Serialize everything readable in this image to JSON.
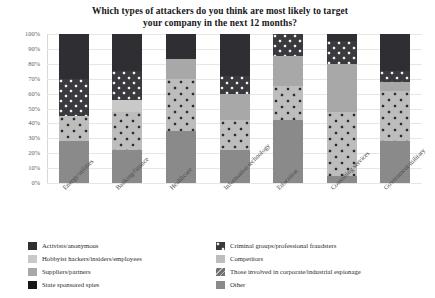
{
  "chart_data": {
    "type": "bar",
    "title": "Which types of attackers do you think are most likely to target your company in the next 12 months?",
    "title_line1": "Which types of attackers do you think are most likely to target",
    "title_line2": "your company in the next 12 months?",
    "xlabel": "",
    "ylabel": "",
    "ylim": [
      0,
      100
    ],
    "ytick_labels": [
      "100%",
      "90%",
      "80%",
      "70%",
      "60%",
      "50%",
      "40%",
      "30%",
      "20%",
      "10%",
      "0%"
    ],
    "ytick_values": [
      100,
      90,
      80,
      70,
      60,
      50,
      40,
      30,
      20,
      10,
      0
    ],
    "grid": true,
    "stacked": true,
    "stack_mode": "percent",
    "legend_position": "bottom",
    "categories": [
      "Energy/utilities",
      "Banking/finance",
      "Healthcare",
      "Information technology",
      "Education",
      "Consulting services",
      "Government/military"
    ],
    "series": [
      {
        "name": "Other",
        "pattern": "solid",
        "color": "#8a8a8a",
        "values": [
          28,
          22,
          35,
          22,
          42,
          5,
          28
        ]
      },
      {
        "name": "Competitors",
        "pattern": "dots",
        "color": "#bdbdbd",
        "values": [
          17,
          26,
          35,
          20,
          23,
          43,
          34
        ]
      },
      {
        "name": "Those involved in corporate/industrial espionage",
        "pattern": "diagonal",
        "color": "#6f6f74",
        "values": [
          0,
          0,
          0,
          0,
          0,
          0,
          0
        ]
      },
      {
        "name": "Suppliers/partners",
        "pattern": "solid",
        "color": "#a8a8a8",
        "values": [
          0,
          0,
          13,
          18,
          20,
          32,
          6
        ]
      },
      {
        "name": "Hobbyist hackers/insiders/employees",
        "pattern": "solid",
        "color": "#c9c9c9",
        "values": [
          0,
          8,
          0,
          0,
          0,
          0,
          0
        ]
      },
      {
        "name": "Criminal groups/professional fraudsters",
        "pattern": "checker",
        "color": "#3a3a3e",
        "values": [
          25,
          19,
          0,
          12,
          15,
          15,
          7
        ]
      },
      {
        "name": "Activists/anonymous",
        "pattern": "solid",
        "color": "#2f2f33",
        "values": [
          30,
          25,
          17,
          28,
          0,
          5,
          25
        ]
      },
      {
        "name": "State sponsored spies",
        "pattern": "solid",
        "color": "#17171a",
        "values": [
          0,
          0,
          0,
          0,
          0,
          0,
          0
        ]
      }
    ]
  },
  "legend": {
    "left_column": [
      {
        "label": "Activists/anonymous",
        "color": "#2f2f33",
        "pattern": "solid"
      },
      {
        "label": "Hobbyist hackers/insiders/employees",
        "color": "#c9c9c9",
        "pattern": "solid"
      },
      {
        "label": "Suppliers/partners",
        "color": "#a8a8a8",
        "pattern": "solid"
      },
      {
        "label": "State sponsored spies",
        "color": "#17171a",
        "pattern": "solid"
      }
    ],
    "right_column": [
      {
        "label": "Criminal groups/professional fraudsters",
        "color": "#3a3a3e",
        "pattern": "checker"
      },
      {
        "label": "Competitors",
        "color": "#bdbdbd",
        "pattern": "solid"
      },
      {
        "label": "Those involved in corporate/industrial espionage",
        "color": "#6f6f74",
        "pattern": "diagonal"
      },
      {
        "label": "Other",
        "color": "#8a8a8a",
        "pattern": "solid"
      }
    ]
  }
}
